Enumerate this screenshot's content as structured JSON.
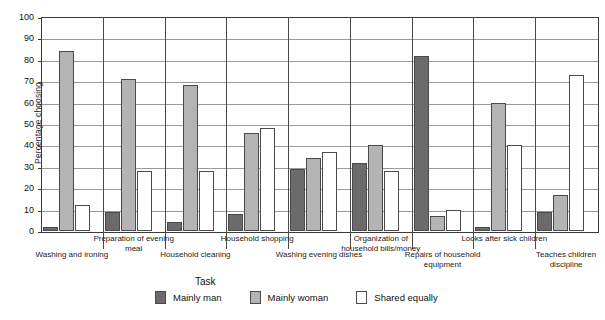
{
  "chart_data": {
    "type": "bar",
    "title": "",
    "xlabel": "Task",
    "ylabel": "Percentage choosing",
    "ylim": [
      0,
      100
    ],
    "ytick_step": 10,
    "yticks": [
      0,
      10,
      20,
      30,
      40,
      50,
      60,
      70,
      80,
      90,
      100
    ],
    "grid": true,
    "legend_position": "bottom",
    "categories": [
      "Washing and ironing",
      "Preparation of evening meal",
      "Household cleaning",
      "Household shopping",
      "Washing evening dishes",
      "Organization of household bills/money",
      "Repairs of household equipment",
      "Looks after sick children",
      "Teaches children discipline"
    ],
    "series": [
      {
        "name": "Mainly man",
        "color": "#6b6b6b",
        "values": [
          2,
          9,
          4,
          8,
          29,
          32,
          82,
          2,
          9
        ]
      },
      {
        "name": "Mainly woman",
        "color": "#b4b4b4",
        "values": [
          84,
          71,
          68,
          46,
          34,
          40,
          7,
          60,
          17
        ]
      },
      {
        "name": "Shared equally",
        "color": "#ffffff",
        "values": [
          12,
          28,
          28,
          48,
          37,
          28,
          10,
          40,
          73
        ]
      }
    ]
  },
  "axis": {
    "y_title": "Percentage choosing",
    "x_title": "Task"
  },
  "legend": {
    "items": [
      {
        "label": "Mainly man",
        "key": "man"
      },
      {
        "label": "Mainly woman",
        "key": "woman"
      },
      {
        "label": "Shared equally",
        "key": "shared"
      }
    ]
  }
}
